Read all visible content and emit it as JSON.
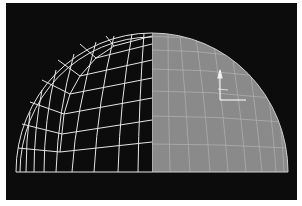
{
  "viewport": {
    "background": "#0c0c0c",
    "frame_color": "#ffffff"
  },
  "model": {
    "name": "hemisphere-dome",
    "left_half": {
      "display_mode": "wireframe",
      "wire_color": "#e6e6e6"
    },
    "right_half": {
      "display_mode": "shaded-with-wireframe",
      "fill_color": "#8a8a8a",
      "wire_color": "#bdbdbd"
    }
  },
  "gizmo": {
    "icon": "transform-gizmo-icon",
    "color": "#f0f0f0"
  }
}
